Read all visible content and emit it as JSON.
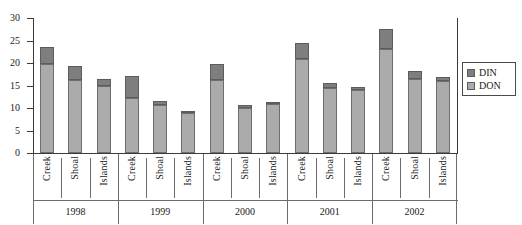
{
  "chart_data": {
    "type": "bar",
    "stacked": true,
    "title": "",
    "xlabel": "",
    "ylabel": "",
    "ylim": [
      0,
      30
    ],
    "yticks": [
      0,
      5,
      10,
      15,
      20,
      25,
      30
    ],
    "ytick_labels": [
      "0",
      "5",
      "10",
      "15",
      "20",
      "25",
      "30"
    ],
    "grid": false,
    "legend_position": "right",
    "categories": [
      "Creek",
      "Shoal",
      "Islands",
      "Creek",
      "Shoal",
      "Islands",
      "Creek",
      "Shoal",
      "Islands",
      "Creek",
      "Shoal",
      "Islands",
      "Creek",
      "Shoal",
      "Islands"
    ],
    "groups": [
      {
        "label": "1998",
        "categories": [
          "Creek",
          "Shoal",
          "Islands"
        ]
      },
      {
        "label": "1999",
        "categories": [
          "Creek",
          "Shoal",
          "Islands"
        ]
      },
      {
        "label": "2000",
        "categories": [
          "Creek",
          "Shoal",
          "Islands"
        ]
      },
      {
        "label": "2001",
        "categories": [
          "Creek",
          "Shoal",
          "Islands"
        ]
      },
      {
        "label": "2002",
        "categories": [
          "Creek",
          "Shoal",
          "Islands"
        ]
      }
    ],
    "series": [
      {
        "name": "DON",
        "color": "#ababab",
        "values": [
          19.8,
          16.3,
          15.0,
          12.3,
          10.7,
          8.8,
          16.3,
          10.0,
          10.8,
          21.0,
          14.5,
          13.9,
          23.2,
          16.4,
          16.0
        ]
      },
      {
        "name": "DIN",
        "color": "#7e7e7e",
        "values": [
          3.8,
          3.1,
          1.5,
          4.9,
          0.8,
          0.6,
          3.5,
          0.6,
          0.6,
          3.4,
          1.1,
          0.8,
          4.3,
          1.8,
          1.0
        ]
      }
    ],
    "totals": [
      23.6,
      19.4,
      16.5,
      17.2,
      11.5,
      9.4,
      19.8,
      10.6,
      11.4,
      24.4,
      15.6,
      14.7,
      27.5,
      18.2,
      17.0
    ]
  },
  "legend": {
    "entries": [
      {
        "label": "DIN",
        "color": "#7e7e7e"
      },
      {
        "label": "DON",
        "color": "#ababab"
      }
    ]
  },
  "colors": {
    "din": "#7e7e7e",
    "don": "#ababab",
    "axis": "#3a3a3a",
    "background": "#ffffff"
  }
}
